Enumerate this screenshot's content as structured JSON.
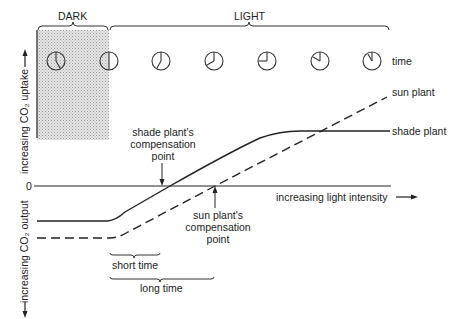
{
  "periods": {
    "dark": "DARK",
    "light": "LIGHT"
  },
  "axes": {
    "y_up": "increasing CO₂ uptake",
    "y_down": "increasing CO₂ output",
    "x": "increasing light intensity",
    "zero": "0",
    "time": "time"
  },
  "clocks": [
    {
      "hour_angle": 150,
      "minute_angle": 330
    },
    {
      "hour_angle": 0,
      "minute_angle": 180
    },
    {
      "hour_angle": 0,
      "minute_angle": 210
    },
    {
      "hour_angle": 0,
      "minute_angle": 240
    },
    {
      "hour_angle": 0,
      "minute_angle": 270
    },
    {
      "hour_angle": 0,
      "minute_angle": 300
    },
    {
      "hour_angle": 0,
      "minute_angle": 330
    }
  ],
  "series": {
    "sun": "sun plant",
    "shade": "shade plant"
  },
  "annotations": {
    "shade_comp_1": "shade plant's",
    "shade_comp_2": "compensation",
    "shade_comp_3": "point",
    "sun_comp_1": "sun plant's",
    "sun_comp_2": "compensation",
    "sun_comp_3": "point",
    "short_time": "short time",
    "long_time": "long time"
  },
  "colors": {
    "ink": "#222222",
    "shade_region": "#d8d8d8"
  }
}
